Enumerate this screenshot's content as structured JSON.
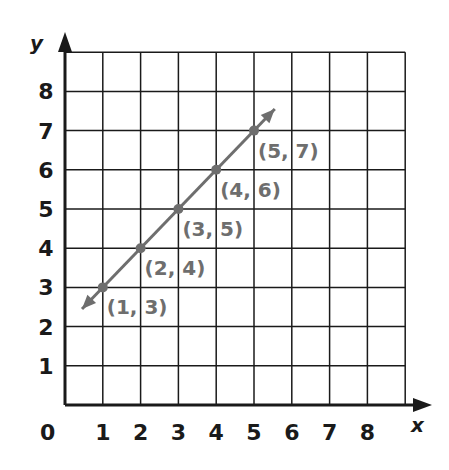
{
  "chart_data": {
    "type": "line",
    "title": "",
    "xlabel": "x",
    "ylabel": "y",
    "xlim": [
      0,
      9
    ],
    "ylim": [
      0,
      9
    ],
    "grid": true,
    "x_ticks": [
      "1",
      "2",
      "3",
      "4",
      "5",
      "6",
      "7",
      "8"
    ],
    "y_ticks": [
      "1",
      "2",
      "3",
      "4",
      "5",
      "6",
      "7",
      "8"
    ],
    "origin_label": "0",
    "series": [
      {
        "name": "line",
        "color": "#6e6e6e",
        "points": [
          [
            1,
            3
          ],
          [
            2,
            4
          ],
          [
            3,
            5
          ],
          [
            4,
            6
          ],
          [
            5,
            7
          ]
        ],
        "labels": [
          "(1, 3)",
          "(2, 4)",
          "(3, 5)",
          "(4, 6)",
          "(5, 7)"
        ],
        "arrows_both_ends": true
      }
    ]
  },
  "colors": {
    "grid": "#1a1a1a",
    "line": "#6e6e6e"
  }
}
